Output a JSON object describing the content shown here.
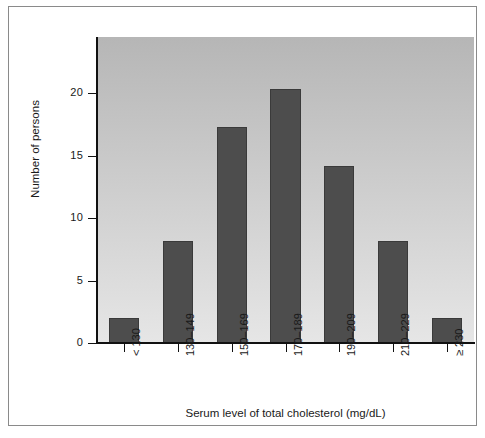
{
  "chart_data": {
    "type": "bar",
    "title": "",
    "subtitle": "",
    "xlabel": "Serum level of total cholesterol (mg/dL)",
    "ylabel": "Number of persons",
    "categories": [
      "< 130",
      "130–149",
      "150–169",
      "170–189",
      "190–209",
      "210–229",
      "≥ 230"
    ],
    "values": [
      2,
      8.2,
      17.3,
      20.3,
      14.2,
      8.2,
      2
    ],
    "ylim": [
      0,
      24.5
    ],
    "xlim_categories": 7,
    "yticks": [
      0,
      5,
      10,
      15,
      20
    ],
    "ytick_labels": [
      "0",
      "5",
      "10",
      "15",
      "20"
    ],
    "grid": false,
    "legend": null,
    "bar_color": "#4d4d4d",
    "bar_edge_color": "#3a3a3a",
    "plot_background_gradient_top": "#b6b6b6",
    "plot_background_gradient_bottom": "#e6e6e6",
    "axis_color": "#111111",
    "frame_border_color": "#8a8a8a",
    "figure_background": "#ffffff"
  }
}
